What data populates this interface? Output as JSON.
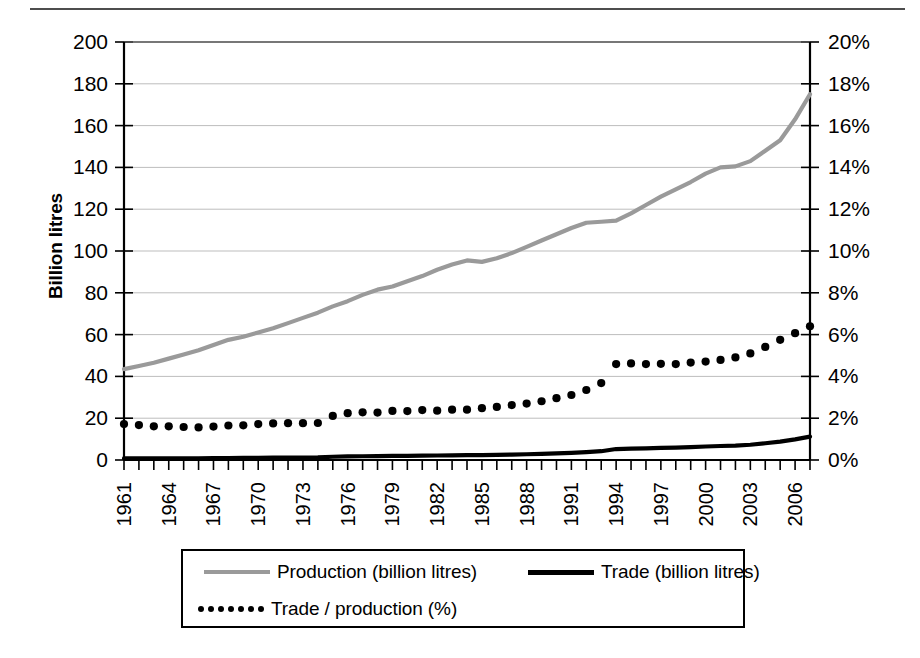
{
  "chart_data": {
    "type": "line",
    "title": "",
    "xlabel": "",
    "ylabel": "Billion litres",
    "ylabel_right": "",
    "ylim": [
      0,
      200
    ],
    "ylim_right": [
      0,
      20
    ],
    "grid": true,
    "legend_position": "bottom",
    "x": [
      1961,
      1962,
      1963,
      1964,
      1965,
      1966,
      1967,
      1968,
      1969,
      1970,
      1971,
      1972,
      1973,
      1974,
      1975,
      1976,
      1977,
      1978,
      1979,
      1980,
      1981,
      1982,
      1983,
      1984,
      1985,
      1986,
      1987,
      1988,
      1989,
      1990,
      1991,
      1992,
      1993,
      1994,
      1995,
      1996,
      1997,
      1998,
      1999,
      2000,
      2001,
      2002,
      2003,
      2004,
      2005,
      2006,
      2007
    ],
    "x_tick_labels": [
      "1961",
      "1964",
      "1967",
      "1970",
      "1973",
      "1976",
      "1979",
      "1982",
      "1985",
      "1988",
      "1991",
      "1994",
      "1997",
      "2000",
      "2003",
      "2006"
    ],
    "y_tick_labels": [
      "0",
      "20",
      "40",
      "60",
      "80",
      "100",
      "120",
      "140",
      "160",
      "180",
      "200"
    ],
    "y_tick_labels_right": [
      "0%",
      "2%",
      "4%",
      "6%",
      "8%",
      "10%",
      "12%",
      "14%",
      "16%",
      "18%",
      "20%"
    ],
    "series": [
      {
        "name": "Production (billion litres)",
        "axis": "left",
        "style": "solid",
        "color": "#9a9a9a",
        "units": "billion litres",
        "values": [
          43.5,
          45.0,
          46.5,
          48.5,
          50.5,
          52.5,
          55.0,
          57.5,
          59.0,
          61.0,
          63.0,
          65.5,
          68.0,
          70.5,
          73.5,
          76.0,
          79.0,
          81.5,
          83.0,
          85.5,
          88.0,
          91.0,
          93.5,
          95.5,
          94.8,
          96.5,
          99.0,
          102.0,
          105.0,
          108.0,
          111.0,
          113.5,
          114.0,
          114.5,
          118.0,
          122.0,
          126.0,
          129.5,
          133.0,
          137.0,
          140.0,
          140.5,
          143.0,
          148.0,
          153.0,
          163.0,
          175.0
        ]
      },
      {
        "name": "Trade (billion litres)",
        "axis": "left",
        "style": "solid",
        "color": "#000000",
        "units": "billion litres",
        "values": [
          0.75,
          0.75,
          0.75,
          0.78,
          0.8,
          0.82,
          0.88,
          0.95,
          0.98,
          1.05,
          1.1,
          1.15,
          1.2,
          1.25,
          1.55,
          1.7,
          1.8,
          1.85,
          1.95,
          2.0,
          2.1,
          2.15,
          2.25,
          2.3,
          2.35,
          2.45,
          2.6,
          2.75,
          2.95,
          3.2,
          3.45,
          3.8,
          4.2,
          5.25,
          5.45,
          5.6,
          5.8,
          5.95,
          6.2,
          6.45,
          6.7,
          6.9,
          7.3,
          8.0,
          8.8,
          9.9,
          11.2
        ]
      },
      {
        "name": "Trade / production (%)",
        "axis": "right",
        "style": "dotted",
        "color": "#000000",
        "units": "%",
        "values": [
          1.72,
          1.67,
          1.61,
          1.61,
          1.58,
          1.56,
          1.6,
          1.65,
          1.66,
          1.72,
          1.75,
          1.76,
          1.76,
          1.77,
          2.11,
          2.24,
          2.28,
          2.27,
          2.35,
          2.34,
          2.39,
          2.36,
          2.41,
          2.41,
          2.48,
          2.54,
          2.63,
          2.7,
          2.81,
          2.96,
          3.11,
          3.35,
          3.68,
          4.59,
          4.62,
          4.59,
          4.6,
          4.59,
          4.66,
          4.71,
          4.79,
          4.91,
          5.1,
          5.41,
          5.75,
          6.07,
          6.4
        ]
      }
    ]
  },
  "axes": {
    "left_title": "Billion litres"
  },
  "legend": {
    "items": [
      {
        "label": "Production (billion litres)",
        "marker": "solid-gray-line"
      },
      {
        "label": "Trade (billion litres)",
        "marker": "solid-black-line"
      },
      {
        "label": "Trade / production (%)",
        "marker": "dotted-black-line"
      }
    ]
  }
}
